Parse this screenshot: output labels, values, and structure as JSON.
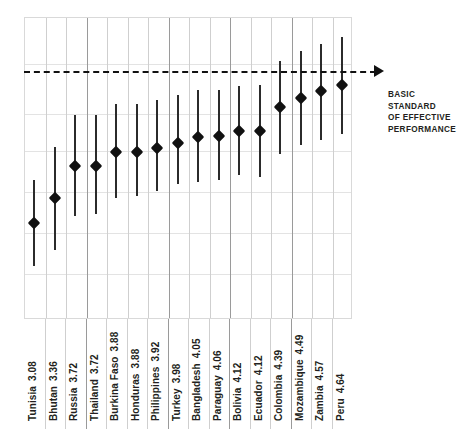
{
  "annotation": {
    "text": "BASIC\nSTANDARD\nOF EFFECTIVE\nPERFORMANCE",
    "arrow_icon": "arrow-right-icon"
  },
  "chart_data": {
    "type": "scatter",
    "title": "",
    "subtitle": "",
    "xlabel": "",
    "ylabel": "",
    "grid": true,
    "legend_position": "none",
    "ylim": [
      2.0,
      5.4
    ],
    "reference_line": {
      "label": "BASIC STANDARD OF EFFECTIVE PERFORMANCE",
      "value": 4.79,
      "style": "dashed",
      "color": "#111111"
    },
    "marker_style": "diamond",
    "marker_color": "#111111",
    "error_bar_color": "#2b2b2b",
    "categories": [
      "Tunisia",
      "Bhutan",
      "Russia",
      "Thailand",
      "Burkina Faso",
      "Honduras",
      "Philippines",
      "Turkey",
      "Bangladesh",
      "Paraguay",
      "Bolivia",
      "Ecuador",
      "Colombia",
      "Mozambique",
      "Zambia",
      "Peru"
    ],
    "values": [
      3.08,
      3.36,
      3.72,
      3.72,
      3.88,
      3.88,
      3.92,
      3.98,
      4.05,
      4.06,
      4.12,
      4.12,
      4.39,
      4.49,
      4.57,
      4.64
    ],
    "error_low": [
      2.6,
      2.78,
      3.16,
      3.18,
      3.36,
      3.38,
      3.44,
      3.52,
      3.54,
      3.56,
      3.62,
      3.6,
      3.86,
      3.96,
      4.02,
      4.08
    ],
    "error_high": [
      3.56,
      3.94,
      4.3,
      4.3,
      4.42,
      4.42,
      4.46,
      4.52,
      4.58,
      4.58,
      4.62,
      4.64,
      4.9,
      5.02,
      5.1,
      5.18
    ],
    "points": [
      {
        "label": "Tunisia",
        "value": 3.08,
        "value_text": "3.08"
      },
      {
        "label": "Bhutan",
        "value": 3.36,
        "value_text": "3.36"
      },
      {
        "label": "Russia",
        "value": 3.72,
        "value_text": "3.72"
      },
      {
        "label": "Thailand",
        "value": 3.72,
        "value_text": "3.72"
      },
      {
        "label": "Burkina Faso",
        "value": 3.88,
        "value_text": "3.88"
      },
      {
        "label": "Honduras",
        "value": 3.88,
        "value_text": "3.88"
      },
      {
        "label": "Philippines",
        "value": 3.92,
        "value_text": "3.92"
      },
      {
        "label": "Turkey",
        "value": 3.98,
        "value_text": "3.98"
      },
      {
        "label": "Bangladesh",
        "value": 4.05,
        "value_text": "4.05"
      },
      {
        "label": "Paraguay",
        "value": 4.06,
        "value_text": "4.06"
      },
      {
        "label": "Bolivia",
        "value": 4.12,
        "value_text": "4.12"
      },
      {
        "label": "Ecuador",
        "value": 4.12,
        "value_text": "4.12"
      },
      {
        "label": "Colombia",
        "value": 4.39,
        "value_text": "4.39"
      },
      {
        "label": "Mozambique",
        "value": 4.49,
        "value_text": "4.49"
      },
      {
        "label": "Zambia",
        "value": 4.57,
        "value_text": "4.57"
      },
      {
        "label": "Peru",
        "value": 4.64,
        "value_text": "4.64"
      }
    ]
  }
}
